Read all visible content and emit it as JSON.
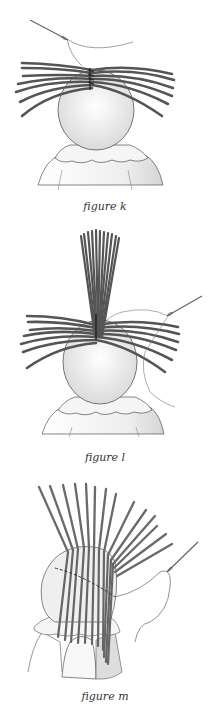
{
  "figures": [
    {
      "id": "k",
      "caption": "figure k",
      "description": "Horizontal strands of yarn stitched at the center part of a doll head, needle and thread above"
    },
    {
      "id": "l",
      "caption": "figure l",
      "description": "Vertical bundle of strands stitched at the top center over horizontal strands, needle on right"
    },
    {
      "id": "m",
      "caption": "figure m",
      "description": "Strands fanned around the back of the head and stitched along a dashed seam line, needle on right"
    }
  ],
  "colors": {
    "strand": "#555555",
    "outline": "#444444",
    "head_fill": "#ececec",
    "body_fill": "#f2f2f2",
    "caption": "#333333"
  }
}
